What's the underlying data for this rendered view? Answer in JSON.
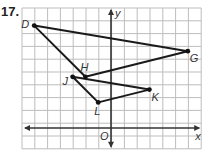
{
  "problem": {
    "number": "17."
  },
  "axes": {
    "x_label": "x",
    "y_label": "y",
    "origin_label": "O"
  },
  "grid": {
    "left": 22,
    "top": 8,
    "cols": 14,
    "rows": 11,
    "spacing": 12.8,
    "origin_px": [
      111,
      128
    ],
    "line_color": "#bdbdbd",
    "axis_color": "#333333"
  },
  "points": [
    {
      "name": "D",
      "coord": [
        -6,
        8
      ]
    },
    {
      "name": "G",
      "coord": [
        6,
        6
      ]
    },
    {
      "name": "H",
      "coord": [
        -2,
        4
      ]
    },
    {
      "name": "J",
      "coord": [
        -3,
        4
      ]
    },
    {
      "name": "K",
      "coord": [
        3,
        3
      ]
    },
    {
      "name": "L",
      "coord": [
        -1,
        2
      ]
    }
  ],
  "triangles": [
    {
      "name": "DGH",
      "vertices": [
        "D",
        "G",
        "H"
      ]
    },
    {
      "name": "JKL",
      "vertices": [
        "J",
        "K",
        "L"
      ]
    }
  ]
}
